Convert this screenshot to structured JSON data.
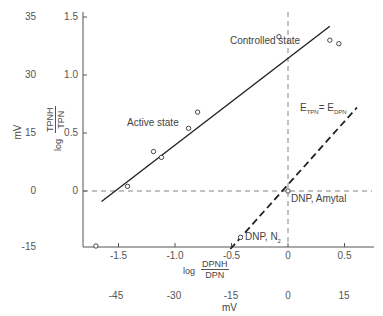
{
  "chart_data": {
    "type": "scatter",
    "title": "",
    "xlabel": "log DPNH/DPN",
    "xlabel_secondary": "mV",
    "ylabel": "log TPNH/TPN",
    "ylabel_secondary": "mV",
    "xlim": [
      -1.75,
      0.75
    ],
    "ylim": [
      -0.48,
      1.55
    ],
    "x_ticks": [
      "-1.5",
      "-1.0",
      "-0.5",
      "0",
      "0.5"
    ],
    "x_tick_values": [
      -1.5,
      -1.0,
      -0.5,
      0,
      0.5
    ],
    "x_mv_ticks": [
      "-45",
      "-30",
      "-15",
      "0",
      "15"
    ],
    "y_ticks": [
      "1.5",
      "1.0",
      "0.5",
      "0"
    ],
    "y_tick_values": [
      1.5,
      1.0,
      0.5,
      0
    ],
    "y_mv_ticks": [
      "35",
      "30",
      "15",
      "0",
      "-15"
    ],
    "grid": false,
    "series": [
      {
        "name": "Observed states",
        "marker": "open-circle",
        "points": [
          {
            "x": -1.7,
            "y": -0.48
          },
          {
            "x": -1.42,
            "y": 0.04
          },
          {
            "x": -1.19,
            "y": 0.34
          },
          {
            "x": -1.12,
            "y": 0.29
          },
          {
            "x": -0.88,
            "y": 0.54
          },
          {
            "x": -0.8,
            "y": 0.68
          },
          {
            "x": -0.08,
            "y": 1.33
          },
          {
            "x": 0.37,
            "y": 1.3
          },
          {
            "x": 0.45,
            "y": 1.27
          },
          {
            "x": 0.0,
            "y": 0.0,
            "label": "DNP, Amytal"
          },
          {
            "x": -0.42,
            "y": -0.4,
            "label": "DNP, N2"
          }
        ]
      },
      {
        "name": "Regression line",
        "style": "solid",
        "points": [
          {
            "x": -1.65,
            "y": -0.09
          },
          {
            "x": 0.37,
            "y": 1.42
          }
        ]
      },
      {
        "name": "E_TPN = E_DPN",
        "style": "dashed",
        "points": [
          {
            "x": -0.51,
            "y": -0.5
          },
          {
            "x": 0.61,
            "y": 0.72
          }
        ]
      }
    ],
    "reference_lines": [
      {
        "orientation": "horizontal",
        "y": 0,
        "style": "dashed"
      },
      {
        "orientation": "vertical",
        "x": 0,
        "style": "dashed"
      }
    ],
    "annotations": [
      {
        "text": "Controlled state",
        "x": -0.55,
        "y": 1.32
      },
      {
        "text": "Active state",
        "x": -1.35,
        "y": 0.58
      },
      {
        "text": "E_TPN = E_DPN",
        "x": 0.25,
        "y": 0.78
      },
      {
        "text": "DNP, Amytal",
        "x": 0.02,
        "y": -0.05
      },
      {
        "text": "DNP, N2",
        "x": -0.4,
        "y": -0.4
      }
    ]
  },
  "labels": {
    "controlled": "Controlled state",
    "active": "Active state",
    "e_tpn_E": "E",
    "e_tpn_sub": "TPN",
    "e_eq": "= E",
    "e_dpn_sub": "DPN",
    "dnp_amytal": "DNP, Amytal",
    "dnp_n2": "DNP, N",
    "dnp_n2_sub": "2",
    "xlog": "log",
    "x_num": "DPNH",
    "x_den": "DPN",
    "x_mv": "mV",
    "ylog": "log",
    "y_num": "TPNH",
    "y_den": "TPN",
    "y_mv": "mV"
  }
}
